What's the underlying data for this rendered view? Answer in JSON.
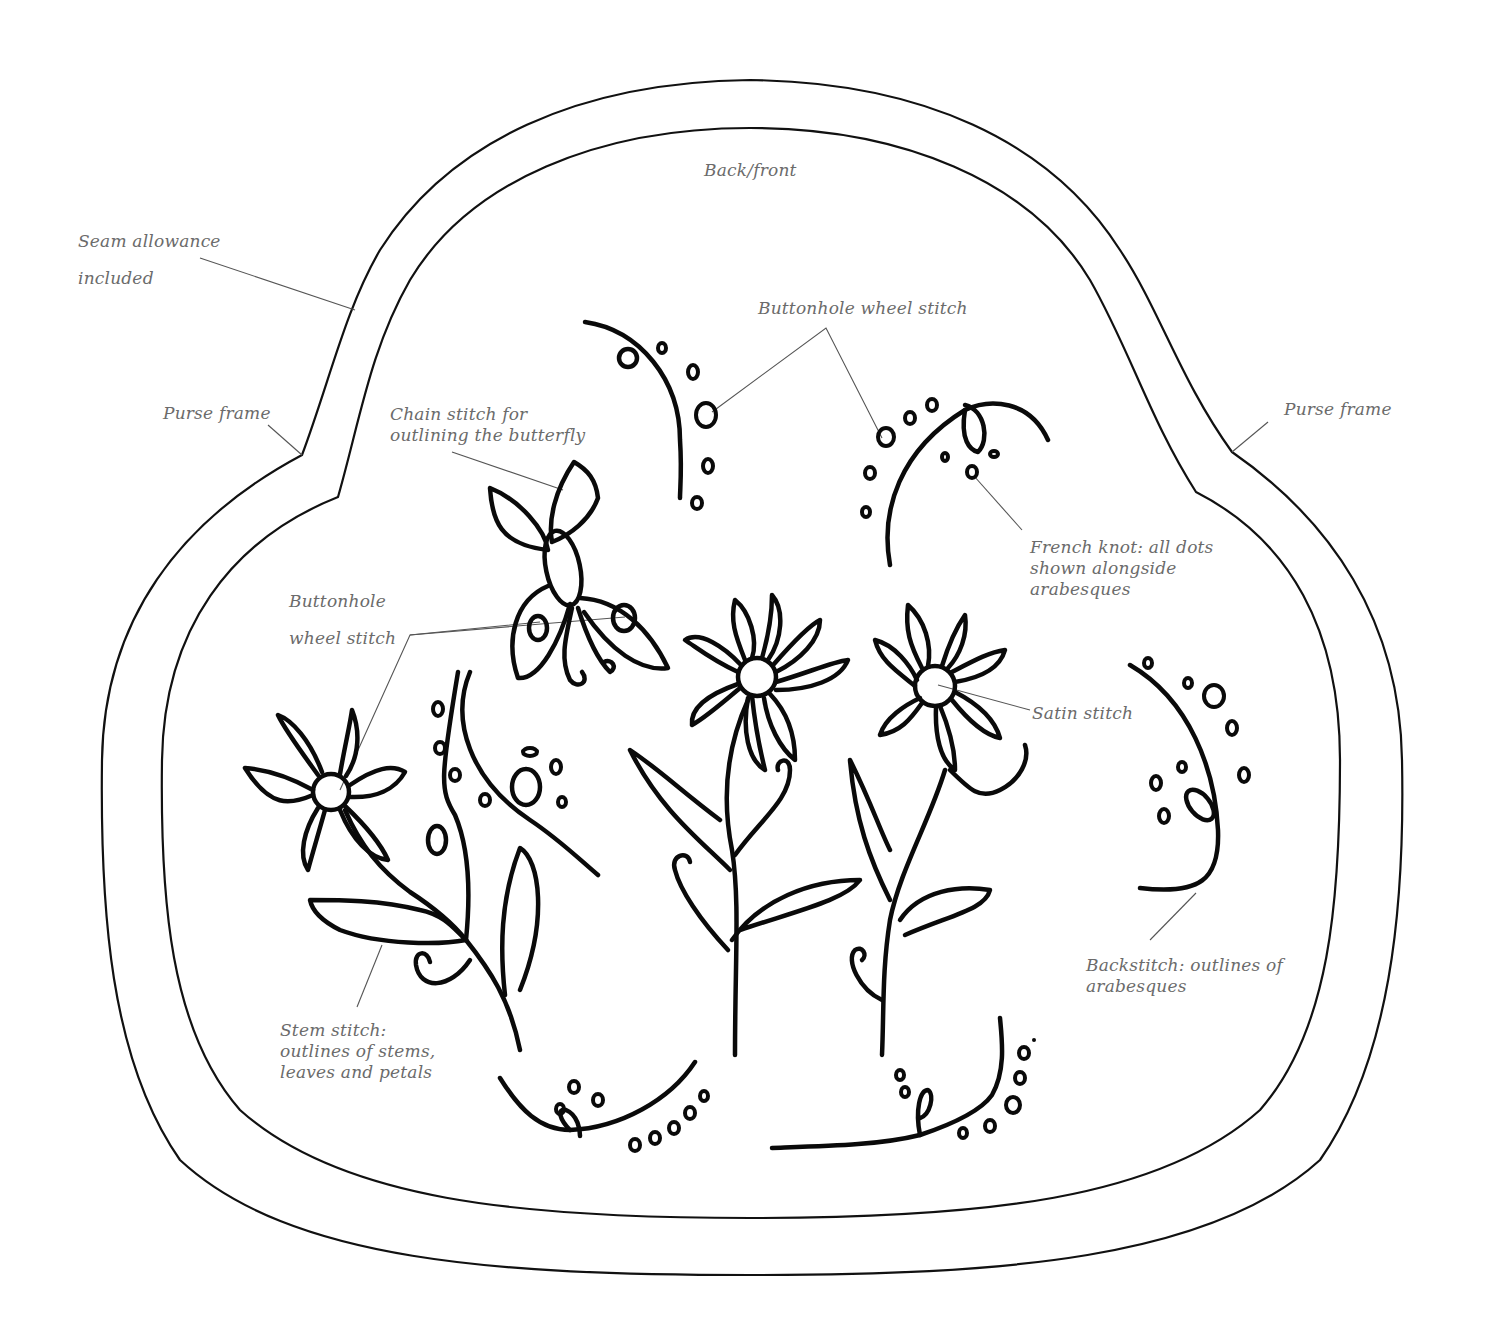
{
  "diagram": {
    "title": "Back/front",
    "type": "embroidery purse pattern",
    "colors": {
      "ink": "#0a0a0a",
      "label": "#6b6b6b",
      "leader": "#555555",
      "background": "#ffffff"
    },
    "labels": {
      "back_front": "Back/front",
      "seam_allowance": "Seam allowance\nincluded",
      "purse_frame_left": "Purse frame",
      "purse_frame_right": "Purse frame",
      "chain_stitch": "Chain stitch for\noutlining the butterfly",
      "buttonhole_wheel_top": "Buttonhole wheel stitch",
      "buttonhole_wheel_left": "Buttonhole\nwheel stitch",
      "french_knot": "French knot: all dots\nshown alongside\narabesques",
      "satin_stitch": "Satin stitch",
      "backstitch": "Backstitch: outlines of\narabesques",
      "stem_stitch": "Stem stitch:\noutlines of stems,\nleaves and petals"
    },
    "motifs": [
      "butterfly",
      "flower-left",
      "flower-center",
      "flower-right",
      "arabesque-top-left",
      "arabesque-top-right",
      "arabesque-right",
      "arabesque-bottom-left",
      "arabesque-bottom-right",
      "arabesque-middle-left"
    ]
  }
}
